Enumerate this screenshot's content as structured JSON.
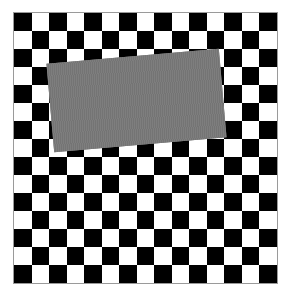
{
  "image": {
    "description": "Checkerboard pattern partially occluded by a rotated gray rectangle",
    "board": {
      "rows": 15,
      "cols": 15,
      "top_left_color": "black",
      "colors": {
        "dark": "#000000",
        "light": "#ffffff"
      }
    },
    "occluder": {
      "shape": "rectangle",
      "color": "#7a7a7a",
      "rotation_deg": -5
    }
  }
}
